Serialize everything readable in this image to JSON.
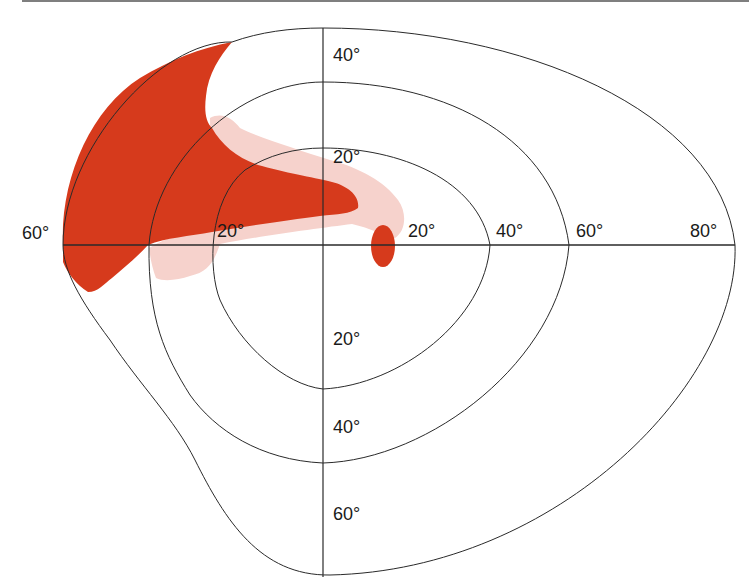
{
  "figure": {
    "type": "visual-field-perimetry-chart",
    "colors": {
      "dense_defect": "#d63a1c",
      "relative_defect": "#f6d2cc",
      "lines": "#2a2a2a",
      "background": "#ffffff"
    },
    "axis_labels": {
      "left_60": "60°",
      "horizontal_left_20": "20°",
      "horizontal_right_20": "20°",
      "horizontal_right_40": "40°",
      "horizontal_right_60": "60°",
      "horizontal_right_80": "80°",
      "vertical_up_20": "20°",
      "vertical_up_40": "40°",
      "vertical_down_20": "20°",
      "vertical_down_40": "40°",
      "vertical_down_60": "60°"
    },
    "isopters": [
      {
        "name": "inner",
        "label": "20°"
      },
      {
        "name": "middle",
        "label": "40°"
      },
      {
        "name": "outer",
        "label": "peripheral boundary"
      }
    ],
    "regions": [
      {
        "name": "dense-scotoma",
        "description": "Dense defect in upper-left (superior nasal/temporal) quadrant extending to center",
        "color": "#d63a1c"
      },
      {
        "name": "relative-scotoma",
        "description": "Relative (lighter) defect surrounding dense area",
        "color": "#f6d2cc"
      },
      {
        "name": "blind-spot",
        "description": "Physiological blind spot just right of center on horizontal meridian",
        "color": "#d63a1c"
      }
    ]
  }
}
